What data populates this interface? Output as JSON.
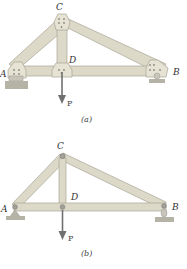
{
  "figures": [
    {
      "id": "a",
      "caption": "(a)",
      "labels": {
        "A": "A",
        "B": "B",
        "C": "C",
        "D": "D",
        "load": "P"
      },
      "joint_type": "gusset plates (riveted)"
    },
    {
      "id": "b",
      "caption": "(b)",
      "labels": {
        "A": "A",
        "B": "B",
        "C": "C",
        "D": "D",
        "load": "P"
      },
      "joint_type": "pins"
    }
  ],
  "colors": {
    "member_fill": "#ddd9c8",
    "member_stroke": "#a8a596",
    "support": "#b5b2a6",
    "arrow": "#707070",
    "pin": "#8a8a80"
  }
}
